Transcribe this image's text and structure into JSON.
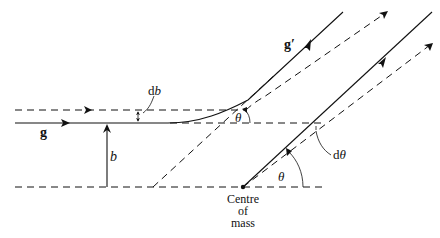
{
  "diagram": {
    "labels": {
      "g": "g",
      "g_prime": "g′",
      "b": "b",
      "db_d": "d",
      "db_b": "b",
      "theta_upper": "θ",
      "theta_lower": "θ",
      "dtheta_d": "d",
      "dtheta_theta": "θ",
      "centre_line1": "Centre",
      "centre_line2": "of",
      "centre_line3": "mass"
    },
    "elements": [
      {
        "name": "incoming-ray-g",
        "style": "solid",
        "from": [
          15,
          123
        ],
        "to": [
          170,
          123
        ]
      },
      {
        "name": "deflected-curve-g-prime",
        "style": "solid",
        "to": [
          343,
          12
        ]
      },
      {
        "name": "incoming-ray-dashed",
        "style": "dashed",
        "from": [
          15,
          110
        ],
        "to": [
          240,
          110
        ]
      },
      {
        "name": "deflected-dashed-ray",
        "style": "dashed",
        "to": [
          386,
          13
        ]
      },
      {
        "name": "centre-of-mass-ray",
        "style": "solid",
        "from": [
          243,
          187
        ],
        "to": [
          432,
          12
        ]
      },
      {
        "name": "centre-of-mass-dashed-ray",
        "style": "dashed",
        "from": [
          243,
          187
        ],
        "to": [
          432,
          44
        ]
      },
      {
        "name": "asymptote-dashed",
        "style": "dashed",
        "from": [
          153,
          187
        ],
        "to": [
          343,
          12
        ]
      },
      {
        "name": "reference-horizontal-upper",
        "style": "dashed",
        "y": 123,
        "to_x": 325
      },
      {
        "name": "reference-horizontal-lower",
        "style": "dashed",
        "y": 187,
        "from_x": 15,
        "to_x": 322
      },
      {
        "name": "impact-parameter-arrow",
        "style": "solid",
        "x": 107,
        "from_y": 187,
        "to_y": 123
      }
    ],
    "centre_of_mass": [
      243,
      187
    ]
  }
}
